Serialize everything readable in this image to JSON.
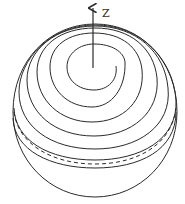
{
  "diagram": {
    "axis": {
      "label": "Z"
    },
    "colors": {
      "stroke": "#2a2a2a",
      "background": "#ffffff"
    }
  }
}
